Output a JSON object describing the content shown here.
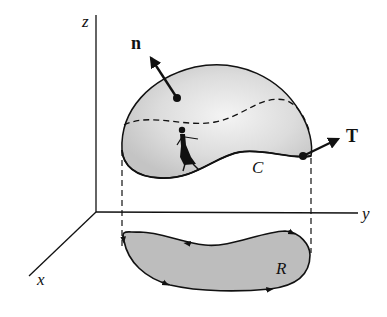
{
  "diagram": {
    "type": "stokes-theorem-illustration",
    "axes": {
      "x_label": "x",
      "y_label": "y",
      "z_label": "z"
    },
    "surface": {
      "normal_vector_label": "n",
      "boundary_curve_label": "C",
      "tangent_vector_label": "T"
    },
    "projection": {
      "region_label": "R"
    },
    "colors": {
      "surface_fill": "#d4d4d4",
      "region_fill": "#bdbdbd",
      "stroke": "#111111"
    }
  }
}
